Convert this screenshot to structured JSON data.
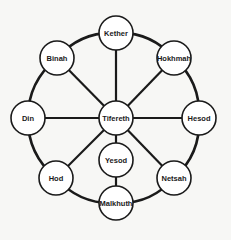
{
  "diagram": {
    "type": "sefirot-wheel",
    "colors": {
      "stroke": "#1a1a1a",
      "node_fill": "#ffffff",
      "background": "#f7f7f5"
    },
    "nodes": [
      {
        "id": "kether",
        "label": "Kether",
        "x": 116,
        "y": 33,
        "r": 17
      },
      {
        "id": "binah",
        "label": "Binah",
        "x": 57,
        "y": 58,
        "r": 17
      },
      {
        "id": "hokhmah",
        "label": "Hokhmah",
        "x": 174,
        "y": 58,
        "r": 17
      },
      {
        "id": "din",
        "label": "Din",
        "x": 28,
        "y": 118,
        "r": 17
      },
      {
        "id": "tifereth",
        "label": "Tifereth",
        "x": 116,
        "y": 118,
        "r": 17
      },
      {
        "id": "hesod",
        "label": "Hesod",
        "x": 199,
        "y": 118,
        "r": 17
      },
      {
        "id": "yesod",
        "label": "Yesod",
        "x": 116,
        "y": 160,
        "r": 17
      },
      {
        "id": "hod",
        "label": "Hod",
        "x": 56,
        "y": 178,
        "r": 17
      },
      {
        "id": "netsah",
        "label": "Netsah",
        "x": 174,
        "y": 178,
        "r": 17
      },
      {
        "id": "malkhuth",
        "label": "Malkhuth",
        "x": 116,
        "y": 203,
        "r": 17
      }
    ],
    "rim": [
      "kether",
      "hokhmah",
      "hesod",
      "netsah",
      "malkhuth",
      "hod",
      "din",
      "binah"
    ],
    "spokes": [
      [
        "tifereth",
        "kether"
      ],
      [
        "tifereth",
        "binah"
      ],
      [
        "tifereth",
        "hokhmah"
      ],
      [
        "tifereth",
        "din"
      ],
      [
        "tifereth",
        "hesod"
      ],
      [
        "tifereth",
        "hod"
      ],
      [
        "tifereth",
        "netsah"
      ],
      [
        "tifereth",
        "yesod"
      ],
      [
        "yesod",
        "malkhuth"
      ]
    ],
    "center": {
      "x": 116,
      "y": 118
    }
  }
}
